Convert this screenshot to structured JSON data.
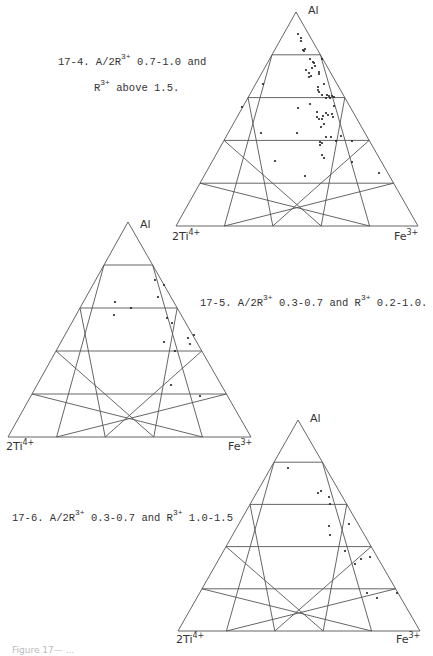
{
  "diagrams": [
    {
      "id": "17-4",
      "caption": {
        "num": "17-4.",
        "prefix": "A/2R",
        "sup1": "3+",
        "range1": "0.7-1.0 and",
        "line2_prefix": "R",
        "sup2": "3+",
        "line2_rest": "above 1.5."
      },
      "vertices": {
        "top": "Al",
        "left": "2Ti",
        "left_sup": "4+",
        "right": "Fe",
        "right_sup": "3+"
      },
      "geometry": {
        "apex": [
          296,
          12
        ],
        "left": [
          176,
          226
        ],
        "right": [
          418,
          226
        ]
      },
      "points": [
        [
          298,
          34
        ],
        [
          301,
          38
        ],
        [
          301,
          41
        ],
        [
          303,
          50
        ],
        [
          305,
          49
        ],
        [
          304,
          51
        ],
        [
          310,
          59
        ],
        [
          313,
          62
        ],
        [
          314,
          63
        ],
        [
          315,
          66
        ],
        [
          312,
          68
        ],
        [
          306,
          70
        ],
        [
          309,
          73
        ],
        [
          311,
          76
        ],
        [
          309,
          77
        ],
        [
          319,
          72
        ],
        [
          319,
          74
        ],
        [
          322,
          59
        ],
        [
          324,
          84
        ],
        [
          318,
          87
        ],
        [
          318,
          90
        ],
        [
          319,
          92
        ],
        [
          322,
          95
        ],
        [
          327,
          95
        ],
        [
          329,
          96
        ],
        [
          330,
          98
        ],
        [
          326,
          98
        ],
        [
          332,
          96
        ],
        [
          334,
          97
        ],
        [
          263,
          84
        ],
        [
          242,
          107
        ],
        [
          298,
          108
        ],
        [
          310,
          104
        ],
        [
          334,
          106
        ],
        [
          317,
          112
        ],
        [
          317,
          117
        ],
        [
          319,
          119
        ],
        [
          322,
          119
        ],
        [
          323,
          116
        ],
        [
          326,
          113
        ],
        [
          328,
          115
        ],
        [
          332,
          114
        ],
        [
          333,
          117
        ],
        [
          324,
          124
        ],
        [
          321,
          127
        ],
        [
          261,
          133
        ],
        [
          297,
          133
        ],
        [
          320,
          142
        ],
        [
          322,
          143
        ],
        [
          326,
          137
        ],
        [
          331,
          137
        ],
        [
          341,
          136
        ],
        [
          336,
          141
        ],
        [
          352,
          141
        ],
        [
          320,
          145
        ],
        [
          322,
          155
        ],
        [
          324,
          158
        ],
        [
          275,
          161
        ],
        [
          352,
          162
        ],
        [
          379,
          173
        ],
        [
          305,
          176
        ]
      ]
    },
    {
      "id": "17-5",
      "caption": {
        "num": "17-5.",
        "prefix": "A/2R",
        "sup1": "3+",
        "range1": "0.3-0.7 and",
        "line2_prefix": "R",
        "sup2": "3+",
        "line2_rest": "0.2-1.0."
      },
      "vertices": {
        "top": "Al",
        "left": "2Ti",
        "left_sup": "4+",
        "right": "Fe",
        "right_sup": "3+"
      },
      "geometry": {
        "apex": [
          128,
          222
        ],
        "left": [
          8,
          437
        ],
        "right": [
          251,
          437
        ]
      },
      "points": [
        [
          155,
          280
        ],
        [
          164,
          285
        ],
        [
          158,
          297
        ],
        [
          115,
          302
        ],
        [
          131,
          308
        ],
        [
          114,
          315
        ],
        [
          167,
          318
        ],
        [
          172,
          323
        ],
        [
          164,
          342
        ],
        [
          188,
          338
        ],
        [
          190,
          344
        ],
        [
          194,
          335
        ],
        [
          175,
          351
        ],
        [
          171,
          385
        ],
        [
          200,
          396
        ]
      ]
    },
    {
      "id": "17-6",
      "caption": {
        "num": "17-6.",
        "prefix": "A/2R",
        "sup1": "3+",
        "range1": "0.3-0.7 and",
        "line2_prefix": "R",
        "sup2": "3+",
        "line2_rest": "1.0-1.5"
      },
      "vertices": {
        "top": "Al",
        "left": "2Ti",
        "left_sup": "4+",
        "right": "Fe",
        "right_sup": "3+"
      },
      "geometry": {
        "apex": [
          298,
          420
        ],
        "left": [
          178,
          631
        ],
        "right": [
          420,
          631
        ]
      },
      "points": [
        [
          288,
          468
        ],
        [
          318,
          493
        ],
        [
          321,
          491
        ],
        [
          329,
          497
        ],
        [
          330,
          504
        ],
        [
          329,
          526
        ],
        [
          349,
          524
        ],
        [
          330,
          535
        ],
        [
          345,
          551
        ],
        [
          355,
          564
        ],
        [
          361,
          559
        ],
        [
          370,
          557
        ],
        [
          367,
          593
        ],
        [
          377,
          598
        ],
        [
          397,
          593
        ]
      ]
    }
  ],
  "footer": "Figure 17— ..."
}
